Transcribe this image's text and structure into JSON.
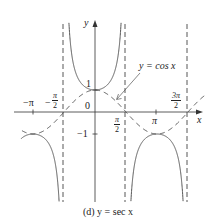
{
  "chart_data": {
    "type": "line",
    "title": "(d) y = sec x",
    "xlabel": "x",
    "ylabel": "y",
    "x_ticks": [
      "-π",
      "-π/2",
      "π/2",
      "π",
      "3π/2"
    ],
    "y_ticks": [
      "1",
      "-1"
    ],
    "origin_label": "0",
    "xlim": [
      -3.85,
      5.7
    ],
    "ylim": [
      -4.0,
      4.2
    ],
    "grid": false,
    "legend": null,
    "series": [
      {
        "name": "y = sec x",
        "style": "solid",
        "description": "secant curve with U-shaped branches; minima at (0,1), maxima at (±π,-1)"
      },
      {
        "name": "y = cos x",
        "style": "dashed",
        "description": "cosine curve, dashed reference"
      }
    ],
    "asymptotes": {
      "style": "dashed",
      "x": [
        "-π/2",
        "π/2",
        "3π/2"
      ]
    },
    "annotations": [
      {
        "text": "y = cos x",
        "points_to": "dashed cosine curve near x ≈ 1.2"
      }
    ]
  },
  "labels": {
    "y_axis": "y",
    "x_axis": "x",
    "origin": "0",
    "one": "1",
    "neg_one": "−1",
    "neg_pi": "−π",
    "neg_half_pi_sign": "−",
    "pi_num": "π",
    "two": "2",
    "three_pi": "3π",
    "pi": "π",
    "cos_annotation": "y = cos x",
    "caption": "(d) y = sec x"
  },
  "colors": {
    "curve": "#555555",
    "axis": "#333333",
    "dash": "#444444"
  }
}
